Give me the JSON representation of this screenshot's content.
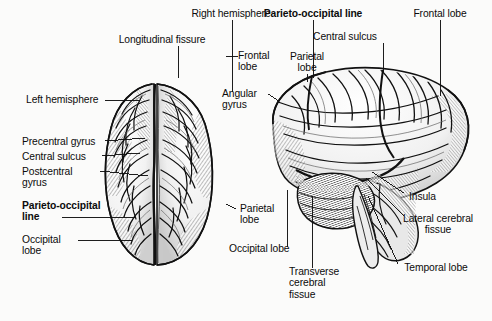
{
  "figure": {
    "type": "anatomical-illustration",
    "style": "black-and-white engraved line drawing",
    "views": [
      {
        "name": "superior-view",
        "description": "Top (superior) view of the cerebrum showing both hemispheres separated by the longitudinal fissure"
      },
      {
        "name": "lateral-view",
        "description": "Left lateral view of the cerebrum with cerebellum and brainstem"
      }
    ],
    "background_color": "#fbfbfa",
    "ink_color": "#111111"
  },
  "labels": [
    {
      "id": "right-hemisphere",
      "text": "Right hemisphere",
      "bold": false,
      "align": "center",
      "x": 231,
      "y": 10,
      "view": "superior-view"
    },
    {
      "id": "longitudinal-fissure",
      "text": "Longitudinal fissure",
      "bold": false,
      "align": "center",
      "x": 162,
      "y": 36,
      "view": "superior-view"
    },
    {
      "id": "left-hemisphere",
      "text": "Left hemisphere",
      "bold": false,
      "align": "left",
      "x": 26,
      "y": 94,
      "view": "superior-view"
    },
    {
      "id": "precentral-gyrus",
      "text": "Precentral gyrus",
      "bold": false,
      "align": "left",
      "x": 22,
      "y": 136,
      "view": "superior-view"
    },
    {
      "id": "central-sulcus-left",
      "text": "Central sulcus",
      "bold": false,
      "align": "left",
      "x": 22,
      "y": 151,
      "view": "superior-view"
    },
    {
      "id": "postcentral-gyrus",
      "text": "Postcentral\ngyrus",
      "bold": false,
      "align": "left",
      "x": 22,
      "y": 166,
      "view": "superior-view"
    },
    {
      "id": "parieto-occipital-line-left",
      "text": "Parieto-occipital\nline",
      "bold": true,
      "align": "left",
      "x": 22,
      "y": 200,
      "view": "superior-view"
    },
    {
      "id": "occipital-lobe-left",
      "text": "Occipital\nlobe",
      "bold": false,
      "align": "left",
      "x": 22,
      "y": 234,
      "view": "superior-view"
    },
    {
      "id": "frontal-lobe-center",
      "text": "Frontal\nlobe",
      "bold": false,
      "align": "left",
      "x": 238,
      "y": 50,
      "view": "superior-view"
    },
    {
      "id": "angular-gyrus",
      "text": "Angular\ngyrus",
      "bold": false,
      "align": "left",
      "x": 226,
      "y": 88,
      "view": "lateral-view"
    },
    {
      "id": "parieto-occipital-line-top",
      "text": "Parieto-occipital line",
      "bold": true,
      "align": "center",
      "x": 313,
      "y": 10,
      "view": "lateral-view"
    },
    {
      "id": "central-sulcus-right",
      "text": "Central sulcus",
      "bold": false,
      "align": "center",
      "x": 345,
      "y": 33,
      "view": "lateral-view"
    },
    {
      "id": "parietal-lobe-top",
      "text": "Parietal\nlobe",
      "bold": false,
      "align": "center",
      "x": 307,
      "y": 53,
      "view": "lateral-view"
    },
    {
      "id": "frontal-lobe-right",
      "text": "Frontal lobe",
      "bold": false,
      "align": "center",
      "x": 440,
      "y": 10,
      "view": "lateral-view"
    },
    {
      "id": "insula",
      "text": "Insula",
      "bold": false,
      "align": "left",
      "x": 406,
      "y": 196,
      "view": "lateral-view"
    },
    {
      "id": "lateral-cerebral-fissue",
      "text": "Lateral cerebral\nfissue",
      "bold": false,
      "align": "center",
      "x": 437,
      "y": 219,
      "view": "lateral-view"
    },
    {
      "id": "temporal-lobe",
      "text": "Temporal lobe",
      "bold": false,
      "align": "center",
      "x": 436,
      "y": 268,
      "view": "lateral-view"
    },
    {
      "id": "parietal-lobe-bottom",
      "text": "Parietal\nlobe",
      "bold": false,
      "align": "left",
      "x": 240,
      "y": 205,
      "view": "lateral-view"
    },
    {
      "id": "occipital-lobe-bottom",
      "text": "Occipital lobe",
      "bold": false,
      "align": "left",
      "x": 229,
      "y": 249,
      "view": "lateral-view"
    },
    {
      "id": "transverse-cerebral-fissue",
      "text": "Transverse\ncerebral\nfissue",
      "bold": false,
      "align": "left",
      "x": 289,
      "y": 270,
      "view": "lateral-view"
    }
  ]
}
